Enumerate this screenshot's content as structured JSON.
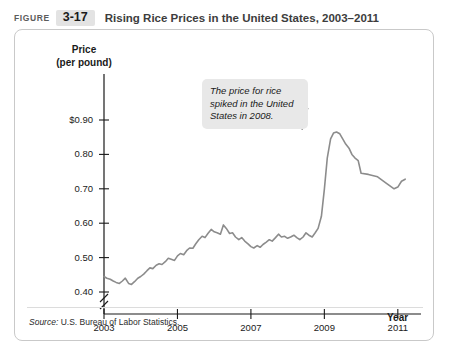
{
  "header": {
    "figure_word": "FIGURE",
    "figure_number": "3-17",
    "title": "Rising Rice Prices in the United States, 2003–2011"
  },
  "callout": {
    "text": "The price for rice spiked in the United States in 2008."
  },
  "source": {
    "prefix": "Source:",
    "text": "U.S. Bureau of Labor Statistics."
  },
  "axis": {
    "y_title_line1": "Price",
    "y_title_line2": "(per pound)",
    "x_title": "Year"
  },
  "chart_data": {
    "type": "line",
    "title": "Rising Rice Prices in the United States, 2003–2011",
    "xlabel": "Year",
    "ylabel": "Price (per pound)",
    "ylim": [
      0.35,
      0.95
    ],
    "xlim": [
      2003,
      2011.25
    ],
    "grid": false,
    "legend": null,
    "axis_break_y": true,
    "ytick_labels": [
      "$0.90",
      "0.80",
      "0.70",
      "0.60",
      "0.50",
      "0.40"
    ],
    "ytick_values": [
      0.9,
      0.8,
      0.7,
      0.6,
      0.5,
      0.4
    ],
    "xtick_labels": [
      "2003",
      "2005",
      "2007",
      "2009",
      "2011"
    ],
    "xtick_values": [
      2003,
      2005,
      2007,
      2009,
      2011
    ],
    "line_color": "#8c8c8c",
    "annotations": [
      {
        "text": "The price for rice spiked in the United States in 2008.",
        "points_to_x": 2008.5,
        "points_to_y": 0.865
      }
    ],
    "series": [
      {
        "name": "Rice price (per pound)",
        "x": [
          2003.0,
          2003.08,
          2003.17,
          2003.25,
          2003.33,
          2003.42,
          2003.5,
          2003.58,
          2003.67,
          2003.75,
          2003.83,
          2003.92,
          2004.0,
          2004.08,
          2004.17,
          2004.25,
          2004.33,
          2004.42,
          2004.5,
          2004.58,
          2004.67,
          2004.75,
          2004.83,
          2004.92,
          2005.0,
          2005.08,
          2005.17,
          2005.25,
          2005.33,
          2005.42,
          2005.5,
          2005.58,
          2005.67,
          2005.75,
          2005.83,
          2005.92,
          2006.0,
          2006.08,
          2006.17,
          2006.25,
          2006.33,
          2006.42,
          2006.5,
          2006.58,
          2006.67,
          2006.75,
          2006.83,
          2006.92,
          2007.0,
          2007.08,
          2007.17,
          2007.25,
          2007.33,
          2007.42,
          2007.5,
          2007.58,
          2007.67,
          2007.75,
          2007.83,
          2007.92,
          2008.0,
          2008.08,
          2008.17,
          2008.25,
          2008.33,
          2008.42,
          2008.5,
          2008.58,
          2008.67,
          2008.75,
          2008.83,
          2008.92,
          2009.0,
          2009.08,
          2009.17,
          2009.25,
          2009.33,
          2009.42,
          2009.5,
          2009.58,
          2009.67,
          2009.75,
          2009.83,
          2009.92,
          2010.0,
          2010.08,
          2010.17,
          2010.25,
          2010.33,
          2010.42,
          2010.5,
          2010.58,
          2010.67,
          2010.75,
          2010.83,
          2010.92,
          2011.0,
          2011.08,
          2011.17
        ],
        "y": [
          0.445,
          0.44,
          0.437,
          0.432,
          0.428,
          0.425,
          0.432,
          0.44,
          0.425,
          0.422,
          0.43,
          0.44,
          0.445,
          0.452,
          0.462,
          0.47,
          0.468,
          0.478,
          0.482,
          0.48,
          0.488,
          0.498,
          0.495,
          0.492,
          0.505,
          0.512,
          0.508,
          0.52,
          0.528,
          0.527,
          0.54,
          0.552,
          0.562,
          0.558,
          0.57,
          0.582,
          0.575,
          0.572,
          0.568,
          0.595,
          0.585,
          0.57,
          0.572,
          0.56,
          0.552,
          0.558,
          0.548,
          0.54,
          0.532,
          0.528,
          0.535,
          0.53,
          0.538,
          0.545,
          0.552,
          0.548,
          0.558,
          0.568,
          0.56,
          0.562,
          0.556,
          0.56,
          0.565,
          0.558,
          0.552,
          0.56,
          0.572,
          0.565,
          0.56,
          0.572,
          0.585,
          0.62,
          0.7,
          0.79,
          0.845,
          0.862,
          0.865,
          0.86,
          0.845,
          0.83,
          0.818,
          0.8,
          0.79,
          0.782,
          0.772,
          0.758,
          0.762,
          0.755,
          0.76,
          0.752,
          0.758,
          0.762,
          0.752,
          0.745,
          0.748,
          0.742,
          0.735,
          0.72,
          0.705
        ]
      }
    ],
    "series_tail": {
      "comment_x": [
        2010.0,
        2010.2,
        2010.45,
        2010.7,
        2010.9,
        2011.0,
        2011.1,
        2011.2
      ],
      "comment_y": [
        0.745,
        0.742,
        0.735,
        0.715,
        0.7,
        0.705,
        0.722,
        0.728
      ]
    }
  }
}
